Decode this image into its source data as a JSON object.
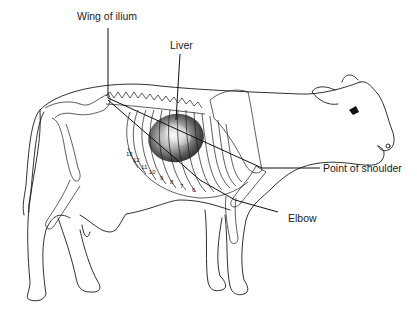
{
  "figure": {
    "labels": {
      "wing_of_ilium": "Wing of ilium",
      "liver": "Liver",
      "point_of_shoulder": "Point of shoulder",
      "elbow": "Elbow"
    },
    "rib_numbers": [
      "13",
      "12",
      "11",
      "10",
      "9",
      "8",
      "7",
      "6"
    ],
    "colors": {
      "line": "#1a1a1a",
      "liver_dark": "#3a3a3a",
      "liver_light": "#e8e8e8",
      "background": "#ffffff"
    }
  }
}
